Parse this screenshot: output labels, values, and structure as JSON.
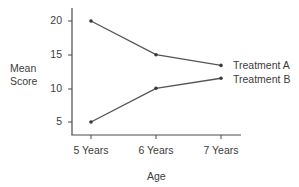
{
  "chart_data": {
    "type": "line",
    "title": "",
    "xlabel": "Age",
    "ylabel": "Mean Score",
    "ylabel_lines": [
      "Mean",
      "Score"
    ],
    "categories": [
      "5 Years",
      "6 Years",
      "7 Years"
    ],
    "yticks": [
      5,
      10,
      15,
      20
    ],
    "ylim": [
      4,
      22
    ],
    "grid": false,
    "legend": "inline labels at right end of lines",
    "series": [
      {
        "name": "Treatment A",
        "values": [
          20,
          15,
          13.4
        ],
        "color": "#555555"
      },
      {
        "name": "Treatment B",
        "values": [
          5,
          10,
          11.5
        ],
        "color": "#555555"
      }
    ]
  },
  "labels": {
    "ylabel_line1": "Mean",
    "ylabel_line2": "Score",
    "xlabel": "Age",
    "ytick_20": "20",
    "ytick_15": "15",
    "ytick_10": "10",
    "ytick_5": "5",
    "xtick_0": "5 Years",
    "xtick_1": "6 Years",
    "xtick_2": "7 Years",
    "series_a": "Treatment A",
    "series_b": "Treatment B"
  },
  "colors": {
    "axis": "#4a4a4a",
    "line": "#555555",
    "text": "#3c3c3c"
  }
}
